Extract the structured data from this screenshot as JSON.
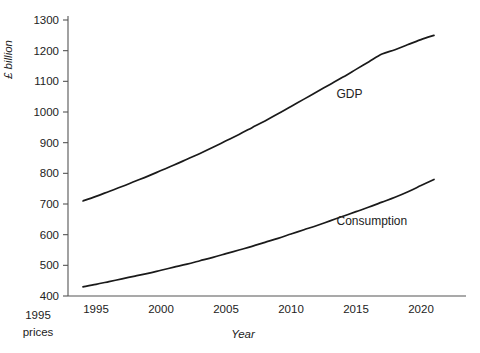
{
  "chart_data": {
    "type": "line",
    "title": "",
    "xlabel": "Year",
    "ylabel": "£ billion",
    "ylabel_note": "1995 prices",
    "xlim": [
      1993.5,
      2021.5
    ],
    "ylim": [
      400,
      1300
    ],
    "grid": false,
    "legend_position": "inline-annotation",
    "y_ticks": [
      400,
      500,
      600,
      700,
      800,
      900,
      1000,
      1100,
      1200,
      1300
    ],
    "y_tick_labels": [
      "400",
      "500",
      "600",
      "700",
      "800",
      "900",
      "1000",
      "1100",
      "1200",
      "1300"
    ],
    "x_ticks": [
      1995,
      2000,
      2005,
      2010,
      2015,
      2020
    ],
    "x_tick_labels": [
      "1995",
      "2000",
      "2005",
      "2010",
      "2015",
      "2020"
    ],
    "x": [
      1994,
      1995,
      1996,
      1997,
      1998,
      1999,
      2000,
      2001,
      2002,
      2003,
      2004,
      2005,
      2006,
      2007,
      2008,
      2009,
      2010,
      2011,
      2012,
      2013,
      2014,
      2015,
      2016,
      2017,
      2018,
      2019,
      2020,
      2021
    ],
    "series": [
      {
        "name": "GDP",
        "color": "#1a1a1a",
        "label_x": 2013.5,
        "label_y": 1045,
        "values": [
          710,
          725,
          741,
          757,
          774,
          791,
          809,
          827,
          846,
          865,
          885,
          906,
          927,
          949,
          971,
          994,
          1018,
          1042,
          1066,
          1090,
          1114,
          1139,
          1164,
          1189,
          1203,
          1220,
          1236,
          1250
        ]
      },
      {
        "name": "Consumption",
        "color": "#1a1a1a",
        "label_x": 2013.5,
        "label_y": 630,
        "values": [
          430,
          438,
          447,
          456,
          465,
          474,
          484,
          494,
          504,
          515,
          526,
          538,
          550,
          562,
          575,
          588,
          602,
          616,
          630,
          645,
          660,
          675,
          690,
          706,
          722,
          740,
          760,
          780
        ]
      }
    ]
  },
  "labels": {
    "y_axis_title": "£ billion",
    "x_axis_title": "Year",
    "corner_line1": "1995",
    "corner_line2": "prices",
    "gdp_label": "GDP",
    "consumption_label": "Consumption"
  }
}
